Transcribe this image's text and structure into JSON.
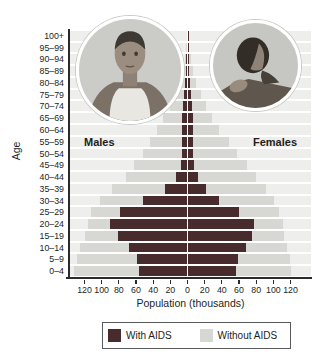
{
  "chart": {
    "y_axis_label": "Age",
    "x_axis_label": "Population (thousands)",
    "left_group_label": "Males",
    "right_group_label": "Females",
    "x_ticks": [
      "120",
      "100",
      "80",
      "60",
      "40",
      "20",
      "0",
      "20",
      "40",
      "60",
      "80",
      "100",
      "120"
    ],
    "legend": [
      {
        "label": "With AIDS",
        "color": "#472b2d"
      },
      {
        "label": "Without AIDS",
        "color": "#d7d7d3"
      }
    ],
    "colors": {
      "with_aids": "#472b2d",
      "without_aids": "#d7d7d3",
      "row_stripe": "#eeeeec",
      "axis": "#2a2a2a"
    }
  },
  "chart_data": {
    "type": "bar",
    "subtype": "population-pyramid",
    "title": "",
    "xlabel": "Population (thousands)",
    "ylabel": "Age",
    "x_tick_interval": 20,
    "xlim_each_side": [
      0,
      120
    ],
    "units": "thousands",
    "categories": [
      "100+",
      "95–99",
      "90–94",
      "85–89",
      "80–84",
      "75–79",
      "70–74",
      "65–69",
      "60–64",
      "55–59",
      "50–54",
      "45–49",
      "40–44",
      "35–39",
      "30–34",
      "25–29",
      "20–24",
      "15–19",
      "10–14",
      "5–9",
      "0–4"
    ],
    "series": [
      {
        "name": "Males without AIDS",
        "side": "left",
        "values": [
          1,
          2,
          3,
          5,
          9,
          14,
          20,
          28,
          36,
          44,
          52,
          62,
          72,
          88,
          102,
          112,
          116,
          119,
          125,
          129,
          132
        ]
      },
      {
        "name": "Males with AIDS",
        "side": "left",
        "values": [
          0.5,
          1,
          1.5,
          2,
          3,
          4,
          5,
          6,
          6,
          6,
          6,
          8,
          13,
          26,
          52,
          79,
          90,
          81,
          68,
          59,
          57
        ]
      },
      {
        "name": "Females without AIDS",
        "side": "right",
        "values": [
          1,
          2,
          4,
          6,
          10,
          16,
          22,
          28,
          37,
          48,
          58,
          69,
          80,
          92,
          101,
          107,
          111,
          113,
          116,
          119,
          121
        ]
      },
      {
        "name": "Females with AIDS",
        "side": "right",
        "values": [
          0.5,
          1,
          1.5,
          2,
          3,
          4,
          5,
          6,
          6,
          6,
          6,
          8,
          12,
          22,
          37,
          60,
          77,
          75,
          68,
          59,
          56
        ]
      }
    ],
    "legend_entries": [
      "With AIDS",
      "Without AIDS"
    ],
    "legend_position": "bottom",
    "grid": false
  }
}
